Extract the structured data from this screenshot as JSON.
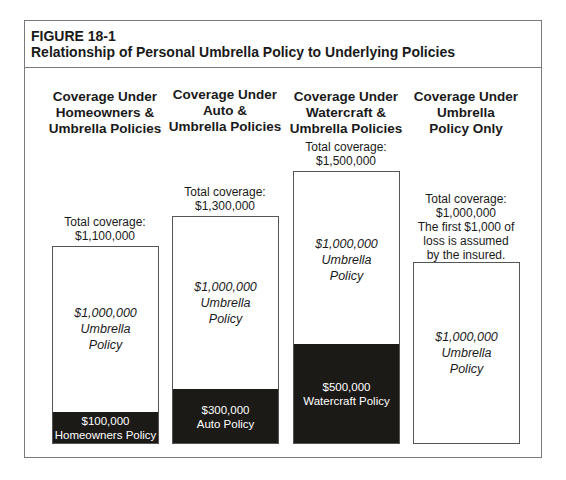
{
  "figure": {
    "number": "FIGURE 18-1",
    "title": "Relationship of Personal Umbrella Policy to Underlying Policies"
  },
  "columns": [
    {
      "heading": [
        "Coverage Under",
        "Homeowners &",
        "Umbrella Policies"
      ],
      "total": [
        "Total coverage:",
        "$1,100,000"
      ],
      "umbrella": [
        "$1,000,000",
        "Umbrella",
        "Policy"
      ],
      "underlying": [
        "$100,000",
        "Homeowners Policy"
      ]
    },
    {
      "heading": [
        "Coverage Under",
        "Auto &",
        "Umbrella Policies"
      ],
      "total": [
        "Total coverage:",
        "$1,300,000"
      ],
      "umbrella": [
        "$1,000,000",
        "Umbrella",
        "Policy"
      ],
      "underlying": [
        "$300,000",
        "Auto Policy"
      ]
    },
    {
      "heading": [
        "Coverage Under",
        "Watercraft &",
        "Umbrella Policies"
      ],
      "total": [
        "Total coverage:",
        "$1,500,000"
      ],
      "umbrella": [
        "$1,000,000",
        "Umbrella",
        "Policy"
      ],
      "underlying": [
        "$500,000",
        "Watercraft Policy"
      ]
    },
    {
      "heading": [
        "Coverage Under",
        "Umbrella",
        "Policy Only"
      ],
      "total": [
        "Total coverage:",
        "$1,000,000",
        "The first $1,000 of",
        "loss is assumed",
        "by the insured."
      ],
      "umbrella": [
        "$1,000,000",
        "Umbrella",
        "Policy"
      ]
    }
  ],
  "colors": {
    "underlying_fill": "#1c1a17",
    "border": "#555555",
    "frame": "#7a7a7a"
  }
}
